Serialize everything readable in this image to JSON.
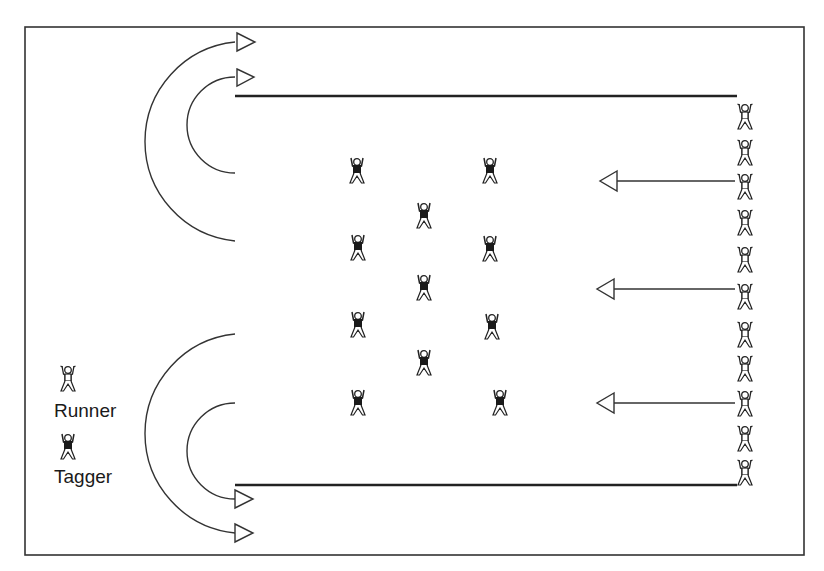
{
  "diagram": {
    "type": "tag-game-field",
    "colors": {
      "line": "#2a2a2a",
      "background": "#ffffff",
      "fill": "#1a1a1a"
    },
    "field_border": {
      "x": 25,
      "y": 27,
      "w": 779,
      "h": 528
    },
    "end_lines": [
      {
        "x1": 235,
        "y1": 96,
        "x2": 737,
        "y2": 96
      },
      {
        "x1": 235,
        "y1": 485,
        "x2": 737,
        "y2": 485
      }
    ],
    "legend": {
      "runner_label": "Runner",
      "tagger_label": "Tagger"
    },
    "runners": [
      {
        "x": 745,
        "y": 116
      },
      {
        "x": 745,
        "y": 152
      },
      {
        "x": 745,
        "y": 186
      },
      {
        "x": 745,
        "y": 222
      },
      {
        "x": 745,
        "y": 259
      },
      {
        "x": 745,
        "y": 296
      },
      {
        "x": 745,
        "y": 334
      },
      {
        "x": 745,
        "y": 368
      },
      {
        "x": 745,
        "y": 403
      },
      {
        "x": 745,
        "y": 438
      },
      {
        "x": 745,
        "y": 472
      }
    ],
    "taggers": [
      {
        "x": 357,
        "y": 170
      },
      {
        "x": 490,
        "y": 170
      },
      {
        "x": 424,
        "y": 215
      },
      {
        "x": 358,
        "y": 247
      },
      {
        "x": 490,
        "y": 248
      },
      {
        "x": 424,
        "y": 287
      },
      {
        "x": 358,
        "y": 324
      },
      {
        "x": 492,
        "y": 326
      },
      {
        "x": 424,
        "y": 362
      },
      {
        "x": 358,
        "y": 402
      },
      {
        "x": 500,
        "y": 402
      }
    ],
    "straight_arrows": [
      {
        "from_x": 735,
        "y": 181,
        "to_x": 600
      },
      {
        "from_x": 735,
        "y": 289,
        "to_x": 597
      },
      {
        "from_x": 735,
        "y": 403,
        "to_x": 597
      }
    ],
    "curved_arrows": [
      {
        "name": "top-outer",
        "start": [
          235,
          241
        ],
        "end": [
          235,
          42
        ],
        "cx": 233,
        "r": 99
      },
      {
        "name": "top-inner",
        "start": [
          235,
          173
        ],
        "end": [
          235,
          77
        ],
        "cx": 233,
        "r": 48
      },
      {
        "name": "bottom-outer",
        "start": [
          235,
          334
        ],
        "end": [
          235,
          533
        ],
        "cx": 233,
        "r": 99
      },
      {
        "name": "bottom-inner",
        "start": [
          235,
          403
        ],
        "end": [
          235,
          499
        ],
        "cx": 233,
        "r": 48
      }
    ]
  }
}
